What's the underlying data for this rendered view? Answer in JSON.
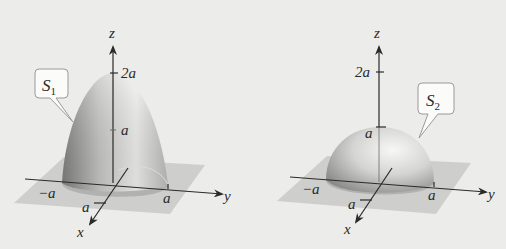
{
  "figure_left": {
    "surface_label": "S",
    "surface_sub": "1",
    "axis_z": "z",
    "axis_y": "y",
    "axis_x": "x",
    "tick_z_top": "2a",
    "tick_z_mid": "a",
    "tick_y_neg": "−a",
    "tick_y_pos": "a",
    "tick_x": "a",
    "shape": "paraboloid"
  },
  "figure_right": {
    "surface_label": "S",
    "surface_sub": "2",
    "axis_z": "z",
    "axis_y": "y",
    "axis_x": "x",
    "tick_z_top": "2a",
    "tick_z_mid": "a",
    "tick_y_neg": "−a",
    "tick_y_pos": "a",
    "tick_x": "a",
    "shape": "hemisphere"
  },
  "colors": {
    "background": "#ececeb",
    "plane": "#c9c9c7",
    "surface_light": "#f2f2f0",
    "surface_dark": "#8f8f8d",
    "axis": "#2a2a2a"
  }
}
